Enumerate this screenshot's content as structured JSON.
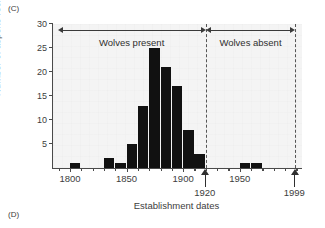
{
  "panels": {
    "current": "(C)",
    "next": "(D)"
  },
  "chart_data": {
    "type": "bar",
    "title": "",
    "subtitle": "",
    "xlabel": "Establishment dates",
    "ylabel": "Number of aspens recruited",
    "xlim": [
      1785,
      2005
    ],
    "ylim": [
      0,
      30
    ],
    "grid": false,
    "legend_position": "none",
    "bin_width": 10,
    "x_ticks": [
      1800,
      1850,
      1900,
      1950
    ],
    "x_tick_labels": [
      "1800",
      "1850",
      "1900",
      "1950"
    ],
    "y_ticks": [
      5,
      10,
      15,
      20,
      25,
      30
    ],
    "y_tick_labels": [
      "5",
      "10",
      "15",
      "20",
      "25",
      "30"
    ],
    "categories": [
      "1795",
      "1805",
      "1815",
      "1825",
      "1835",
      "1845",
      "1855",
      "1865",
      "1875",
      "1885",
      "1895",
      "1905",
      "1915",
      "1925",
      "1935",
      "1945",
      "1955",
      "1965",
      "1975",
      "1985",
      "1995"
    ],
    "values": [
      0,
      1,
      0,
      0,
      2,
      1,
      5,
      13,
      25,
      21,
      17,
      8,
      3,
      0,
      0,
      0,
      1,
      1,
      0,
      0,
      0
    ],
    "bars": [
      {
        "bin_start": 1800,
        "bin_end": 1810,
        "value": 1
      },
      {
        "bin_start": 1830,
        "bin_end": 1840,
        "value": 2
      },
      {
        "bin_start": 1840,
        "bin_end": 1850,
        "value": 1
      },
      {
        "bin_start": 1850,
        "bin_end": 1860,
        "value": 5
      },
      {
        "bin_start": 1860,
        "bin_end": 1870,
        "value": 13
      },
      {
        "bin_start": 1870,
        "bin_end": 1880,
        "value": 25
      },
      {
        "bin_start": 1880,
        "bin_end": 1890,
        "value": 21
      },
      {
        "bin_start": 1890,
        "bin_end": 1900,
        "value": 17
      },
      {
        "bin_start": 1900,
        "bin_end": 1910,
        "value": 8
      },
      {
        "bin_start": 1910,
        "bin_end": 1920,
        "value": 3
      },
      {
        "bin_start": 1950,
        "bin_end": 1960,
        "value": 1
      },
      {
        "bin_start": 1960,
        "bin_end": 1970,
        "value": 1
      }
    ],
    "annotations": [
      {
        "name": "wolves-present",
        "label": "Wolves present",
        "x_start": 1789,
        "x_end": 1920
      },
      {
        "name": "wolves-absent",
        "label": "Wolves absent",
        "x_start": 1920,
        "x_end": 1999
      }
    ],
    "reference_lines": [
      {
        "name": "line-1920",
        "x": 1920,
        "label": "1920",
        "style": "dashed"
      },
      {
        "name": "line-1999",
        "x": 1999,
        "label": "1999",
        "style": "dashed"
      }
    ],
    "colors": {
      "bar": "#111111",
      "axis": "#4a4a4a",
      "plot_background": "#f4f4f4",
      "page_background": "#ffffff",
      "divider": "#555555",
      "text": "#3d3d3d"
    }
  }
}
